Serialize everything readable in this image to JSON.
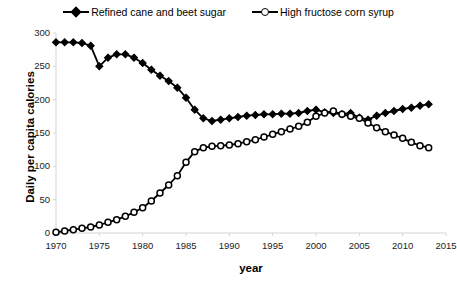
{
  "chart_data": {
    "type": "line",
    "title": "",
    "xlabel": "year",
    "ylabel": "Daily per capita calories",
    "xlim": [
      1970,
      2015
    ],
    "ylim": [
      0,
      300
    ],
    "xticks": [
      1970,
      1975,
      1980,
      1985,
      1990,
      1995,
      2000,
      2005,
      2010,
      2015
    ],
    "yticks": [
      0,
      50,
      100,
      150,
      200,
      250,
      300
    ],
    "grid": false,
    "legend_position": "top-center",
    "x": [
      1970,
      1971,
      1972,
      1973,
      1974,
      1975,
      1976,
      1977,
      1978,
      1979,
      1980,
      1981,
      1982,
      1983,
      1984,
      1985,
      1986,
      1987,
      1988,
      1989,
      1990,
      1991,
      1992,
      1993,
      1994,
      1995,
      1996,
      1997,
      1998,
      1999,
      2000,
      2001,
      2002,
      2003,
      2004,
      2005,
      2006,
      2007,
      2008,
      2009,
      2010,
      2011,
      2012,
      2013
    ],
    "series": [
      {
        "name": "Refined cane and beet sugar",
        "marker": "filled-diamond",
        "color": "#000000",
        "values": [
          286,
          286,
          286,
          285,
          281,
          250,
          263,
          268,
          268,
          263,
          255,
          245,
          236,
          228,
          218,
          203,
          185,
          172,
          168,
          170,
          172,
          174,
          176,
          177,
          178,
          178,
          179,
          179,
          180,
          183,
          185,
          181,
          180,
          178,
          180,
          173,
          170,
          176,
          180,
          183,
          186,
          188,
          191,
          193
        ]
      },
      {
        "name": "High fructose corn syrup",
        "marker": "open-circle",
        "color": "#000000",
        "values": [
          1,
          3,
          5,
          7,
          9,
          12,
          16,
          20,
          25,
          31,
          38,
          48,
          60,
          72,
          86,
          106,
          122,
          128,
          130,
          131,
          132,
          134,
          137,
          140,
          144,
          148,
          152,
          156,
          160,
          166,
          175,
          180,
          183,
          178,
          175,
          172,
          165,
          158,
          152,
          147,
          142,
          136,
          131,
          128
        ]
      }
    ]
  },
  "legend": {
    "entries": [
      {
        "label": "Refined cane and beet sugar",
        "marker": "filled-diamond-icon"
      },
      {
        "label": "High fructose corn syrup",
        "marker": "open-circle-icon"
      }
    ]
  },
  "axes": {
    "y_title": "Daily per capita calories",
    "x_title": "year"
  }
}
